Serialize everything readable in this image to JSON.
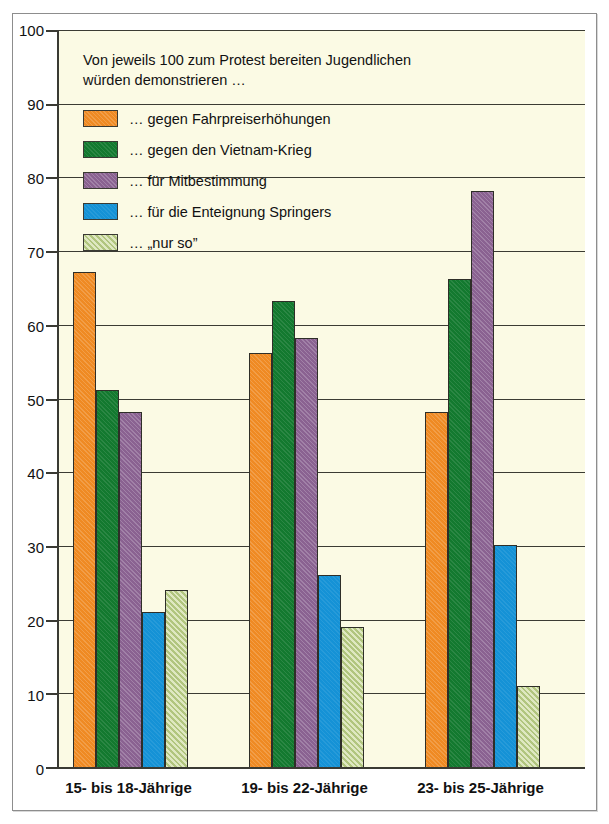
{
  "chart_data": {
    "type": "bar",
    "title": "",
    "subtitle": "",
    "caption": "Von jeweils 100 zum Protest bereiten Jugendlichen\nwürden demonstrieren …",
    "xlabel": "",
    "ylabel": "",
    "ylim": [
      0,
      100
    ],
    "ytick_step": 10,
    "yticks": [
      "100",
      "90",
      "80",
      "70",
      "60",
      "50",
      "40",
      "30",
      "20",
      "10",
      "0"
    ],
    "grid": true,
    "legend_position": "inside-top-left",
    "categories": [
      "15- bis 18-Jährige",
      "19- bis 22-Jährige",
      "23- bis 25-Jährige"
    ],
    "series": [
      {
        "name": "… gegen Fahrpreiserhöhungen",
        "color": "#ef8a23",
        "fill": "fill-orange",
        "values": [
          67,
          56,
          48
        ]
      },
      {
        "name": "… gegen den Vietnam-Krieg",
        "color": "#13792f",
        "fill": "fill-green",
        "values": [
          51,
          63,
          66
        ]
      },
      {
        "name": "… für Mitbestimmung",
        "color": "#8a6291",
        "fill": "fill-purple",
        "values": [
          48,
          58,
          78
        ]
      },
      {
        "name": "… für die Enteignung Springers",
        "color": "#1592d6",
        "fill": "fill-blue",
        "values": [
          21,
          26,
          30
        ]
      },
      {
        "name": "… „nur so”",
        "color": "#c4d58e",
        "fill": "fill-ltgreen",
        "values": [
          24,
          19,
          11
        ]
      }
    ]
  },
  "colors": {
    "plot_background": "#fbfae4",
    "page_background": "#ffffff",
    "axis": "#3a3a33",
    "gridline": "#3b3b33",
    "frame": "#8d8d8d",
    "text": "#111111"
  }
}
